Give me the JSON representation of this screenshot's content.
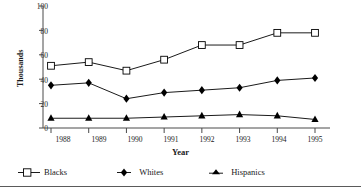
{
  "chart_data": {
    "type": "line",
    "title": "",
    "xlabel": "Year",
    "ylabel": "Thousands",
    "categories": [
      "1988",
      "1989",
      "1990",
      "1991",
      "1992",
      "1993",
      "1994",
      "1995"
    ],
    "x": [
      1988,
      1989,
      1990,
      1991,
      1992,
      1993,
      1994,
      1995
    ],
    "ylim": [
      0,
      100
    ],
    "yticks": [
      0,
      20,
      40,
      60,
      80,
      100
    ],
    "ytick_labels": [
      "0",
      "20",
      "40",
      "60",
      "80",
      "100"
    ],
    "grid": false,
    "legend_position": "bottom-left",
    "series": [
      {
        "name": "Blacks",
        "marker": "open-square",
        "color": "#000000",
        "values": [
          51,
          54,
          47,
          56,
          68,
          68,
          78,
          78
        ]
      },
      {
        "name": "Whites",
        "marker": "filled-diamond",
        "color": "#000000",
        "values": [
          35,
          37,
          24,
          29,
          31,
          33,
          39,
          41
        ]
      },
      {
        "name": "Hispanics",
        "marker": "filled-triangle",
        "color": "#000000",
        "values": [
          8,
          8,
          8,
          9,
          10,
          11,
          10,
          7
        ]
      }
    ]
  },
  "axes": {
    "y_title": "Thousands",
    "x_title": "Year",
    "y_tick_0": "0",
    "y_tick_1": "20",
    "y_tick_2": "40",
    "y_tick_3": "60",
    "y_tick_4": "80",
    "y_tick_5": "100",
    "x_tick_0": "1988",
    "x_tick_1": "1989",
    "x_tick_2": "1990",
    "x_tick_3": "1991",
    "x_tick_4": "1992",
    "x_tick_5": "1993",
    "x_tick_6": "1994",
    "x_tick_7": "1995"
  },
  "legend": {
    "blacks": "Blacks",
    "whites": "Whites",
    "hispanics": "Hispanics"
  },
  "colors": {
    "line": "#000000",
    "axis": "#4a4a4a",
    "text": "#1a1a1a",
    "background": "#ffffff"
  }
}
